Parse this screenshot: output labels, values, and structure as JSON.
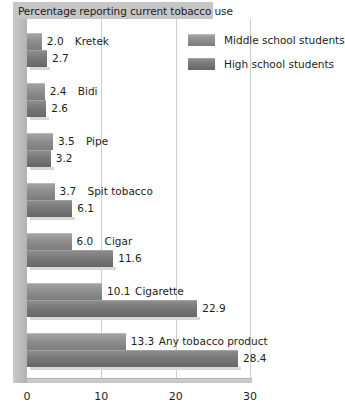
{
  "chart_data": {
    "type": "bar",
    "orientation": "horizontal",
    "title": "Percentage reporting current tobacco use",
    "xlabel": "",
    "ylabel": "",
    "xlim": [
      0,
      30
    ],
    "xticks": [
      0,
      10,
      20,
      30
    ],
    "xtick_labels": [
      "0",
      "10",
      "20",
      "30"
    ],
    "grid": true,
    "legend_position": "top-right",
    "categories": [
      "Kretek",
      "Bidi",
      "Pipe",
      "Spit tobacco",
      "Cigar",
      "Cigarette",
      "Any tobacco product"
    ],
    "series": [
      {
        "name": "Middle school students",
        "color": "#8e8e8e",
        "values": [
          2.0,
          2.4,
          3.5,
          3.7,
          6.0,
          10.1,
          13.3
        ],
        "value_labels": [
          "2.0",
          "2.4",
          "3.5",
          "3.7",
          "6.0",
          "10.1",
          "13.3"
        ]
      },
      {
        "name": "High school students",
        "color": "#787878",
        "values": [
          2.7,
          2.6,
          3.2,
          6.1,
          11.6,
          22.9,
          28.4
        ],
        "value_labels": [
          "2.7",
          "2.6",
          "3.2",
          "6.1",
          "11.6",
          "22.9",
          "28.4"
        ]
      }
    ]
  },
  "legend": {
    "items": [
      {
        "label": "Middle school students"
      },
      {
        "label": "High school students"
      }
    ]
  },
  "colors": {
    "middle_school": "#8e8e8e",
    "high_school": "#787878",
    "title_banner": "#c6c6c6",
    "gridline": "#cdcdcd",
    "background": "#ffffff"
  }
}
